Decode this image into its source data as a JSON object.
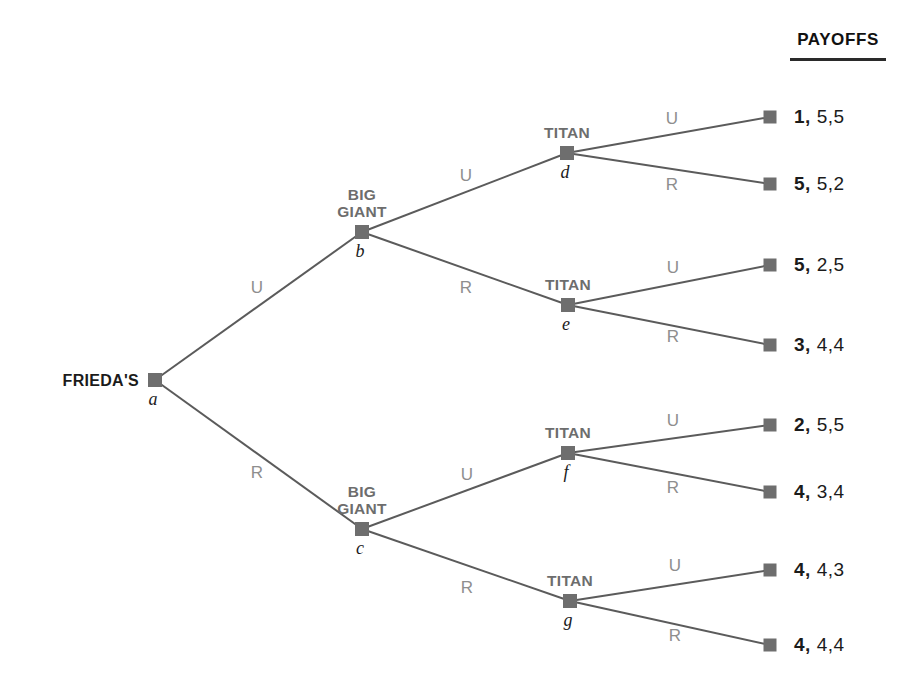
{
  "header": {
    "payoffs_title": "PAYOFFS"
  },
  "tree": {
    "root": {
      "id": "a",
      "player": "FRIEDA'S",
      "label": "a",
      "x": 155,
      "y": 380
    },
    "decision_nodes": [
      {
        "id": "b",
        "player": "BIG\nGIANT",
        "label": "b",
        "x": 362,
        "y": 232
      },
      {
        "id": "c",
        "player": "BIG\nGIANT",
        "label": "c",
        "x": 362,
        "y": 529
      },
      {
        "id": "d",
        "player": "TITAN",
        "label": "d",
        "x": 567,
        "y": 153
      },
      {
        "id": "e",
        "player": "TITAN",
        "label": "e",
        "x": 568,
        "y": 305
      },
      {
        "id": "f",
        "player": "TITAN",
        "label": "f",
        "x": 568,
        "y": 453
      },
      {
        "id": "g",
        "player": "TITAN",
        "label": "g",
        "x": 570,
        "y": 601
      }
    ],
    "branches": [
      {
        "from": "a",
        "to": "b",
        "action": "U",
        "lx": 257,
        "ly": 288
      },
      {
        "from": "a",
        "to": "c",
        "action": "R",
        "lx": 257,
        "ly": 473
      },
      {
        "from": "b",
        "to": "d",
        "action": "U",
        "lx": 466,
        "ly": 176
      },
      {
        "from": "b",
        "to": "e",
        "action": "R",
        "lx": 466,
        "ly": 288
      },
      {
        "from": "c",
        "to": "f",
        "action": "U",
        "lx": 467,
        "ly": 475
      },
      {
        "from": "c",
        "to": "g",
        "action": "R",
        "lx": 467,
        "ly": 588
      },
      {
        "from": "d",
        "to": "t1",
        "action": "U",
        "lx": 672,
        "ly": 119
      },
      {
        "from": "d",
        "to": "t2",
        "action": "R",
        "lx": 672,
        "ly": 185
      },
      {
        "from": "e",
        "to": "t3",
        "action": "U",
        "lx": 673,
        "ly": 268
      },
      {
        "from": "e",
        "to": "t4",
        "action": "R",
        "lx": 673,
        "ly": 337
      },
      {
        "from": "f",
        "to": "t5",
        "action": "U",
        "lx": 673,
        "ly": 421
      },
      {
        "from": "f",
        "to": "t6",
        "action": "R",
        "lx": 673,
        "ly": 488
      },
      {
        "from": "g",
        "to": "t7",
        "action": "U",
        "lx": 675,
        "ly": 566
      },
      {
        "from": "g",
        "to": "t8",
        "action": "R",
        "lx": 675,
        "ly": 636
      }
    ],
    "terminals": [
      {
        "id": "t1",
        "x": 770,
        "y": 117,
        "first": "1,",
        "rest": "5,5"
      },
      {
        "id": "t2",
        "x": 770,
        "y": 184,
        "first": "5,",
        "rest": "5,2"
      },
      {
        "id": "t3",
        "x": 770,
        "y": 265,
        "first": "5,",
        "rest": "2,5"
      },
      {
        "id": "t4",
        "x": 770,
        "y": 345,
        "first": "3,",
        "rest": "4,4"
      },
      {
        "id": "t5",
        "x": 770,
        "y": 425,
        "first": "2,",
        "rest": "5,5"
      },
      {
        "id": "t6",
        "x": 770,
        "y": 492,
        "first": "4,",
        "rest": "3,4"
      },
      {
        "id": "t7",
        "x": 770,
        "y": 570,
        "first": "4,",
        "rest": "4,3"
      },
      {
        "id": "t8",
        "x": 770,
        "y": 645,
        "first": "4,",
        "rest": "4,4"
      }
    ]
  },
  "colors": {
    "node": "#6e6e6e",
    "edge": "#5b5b5b",
    "branch_label": "#8e8e8e",
    "player_label": "#6d6d6d",
    "text": "#1b1b1b"
  }
}
